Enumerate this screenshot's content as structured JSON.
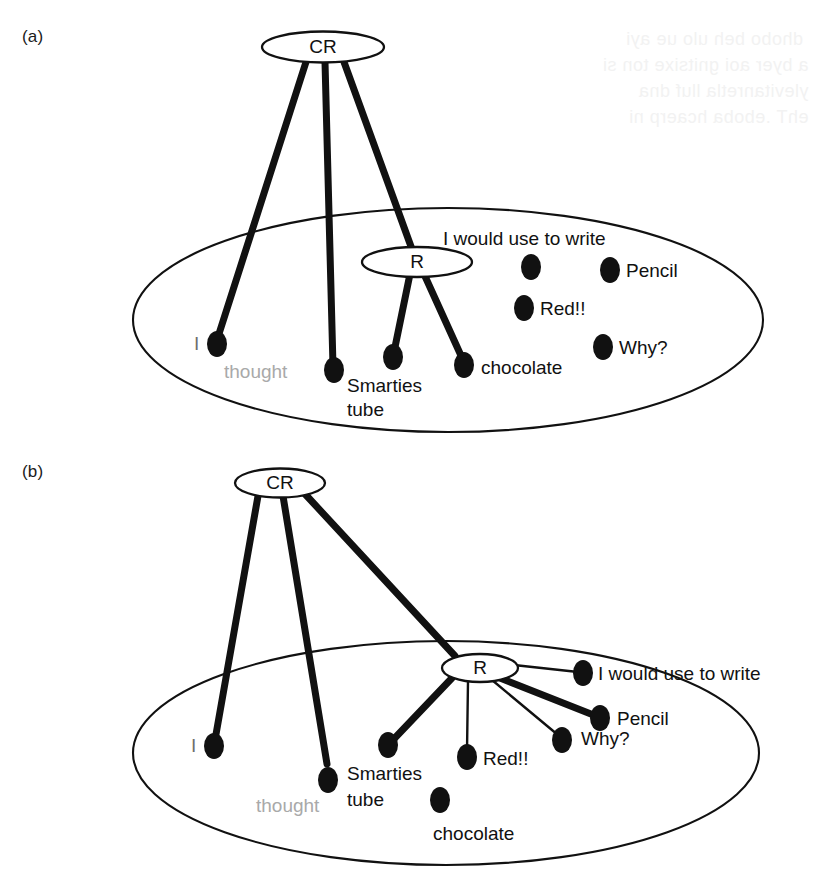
{
  "figure": {
    "type": "concept-map",
    "background": "#ffffff",
    "ink": "#111111",
    "faded_ink": "#a9a9a9",
    "panels": [
      {
        "id": "a",
        "label": "(a)",
        "boundary_name": "context-ellipse",
        "nodes": [
          {
            "id": "CR",
            "label": "CR"
          },
          {
            "id": "R",
            "label": "R"
          }
        ],
        "items": [
          {
            "id": "i",
            "label": "I",
            "style": "faded-small",
            "connected": true,
            "link": "CR"
          },
          {
            "id": "thought",
            "label": "thought",
            "style": "faded",
            "connected": true,
            "link": "CR"
          },
          {
            "id": "smarties",
            "label": "Smarties\ntube",
            "style": "normal",
            "connected": true,
            "link": "R"
          },
          {
            "id": "chocolate",
            "label": "chocolate",
            "style": "normal",
            "connected": true,
            "link": "R"
          },
          {
            "id": "write",
            "label": "I would use to write",
            "style": "normal",
            "connected": false,
            "link": null
          },
          {
            "id": "pencil",
            "label": "Pencil",
            "style": "normal",
            "connected": false,
            "link": null
          },
          {
            "id": "red",
            "label": "Red!!",
            "style": "normal",
            "connected": false,
            "link": null
          },
          {
            "id": "why",
            "label": "Why?",
            "style": "normal",
            "connected": false,
            "link": null
          }
        ]
      },
      {
        "id": "b",
        "label": "(b)",
        "boundary_name": "context-ellipse",
        "nodes": [
          {
            "id": "CR",
            "label": "CR"
          },
          {
            "id": "R",
            "label": "R"
          }
        ],
        "items": [
          {
            "id": "i",
            "label": "I",
            "style": "faded-small",
            "connected": true,
            "link": "CR"
          },
          {
            "id": "thought",
            "label": "thought",
            "style": "faded",
            "connected": true,
            "link": "CR"
          },
          {
            "id": "smarties",
            "label": "Smarties\ntube",
            "style": "normal",
            "connected": true,
            "link": "R"
          },
          {
            "id": "red",
            "label": "Red!!",
            "style": "normal",
            "connected": true,
            "link": "R"
          },
          {
            "id": "why",
            "label": "Why?",
            "style": "normal",
            "connected": true,
            "link": "R"
          },
          {
            "id": "pencil",
            "label": "Pencil",
            "style": "normal",
            "connected": true,
            "link": "R"
          },
          {
            "id": "write",
            "label": "I would use to write",
            "style": "normal",
            "connected": true,
            "link": "R"
          },
          {
            "id": "chocolate",
            "label": "chocolate",
            "style": "normal",
            "connected": false,
            "link": null
          }
        ]
      }
    ]
  },
  "panel_a": {
    "label": "(a)",
    "cr_label": "CR",
    "r_label": "R",
    "item_i": "I",
    "item_thought": "thought",
    "item_smarties_line1": "Smarties",
    "item_smarties_line2": "tube",
    "item_chocolate": "chocolate",
    "item_write": "I would use to write",
    "item_pencil": "Pencil",
    "item_red": "Red!!",
    "item_why": "Why?"
  },
  "panel_b": {
    "label": "(b)",
    "cr_label": "CR",
    "r_label": "R",
    "item_i": "I",
    "item_thought": "thought",
    "item_smarties_line1": "Smarties",
    "item_smarties_line2": "tube",
    "item_chocolate": "chocolate",
    "item_write": "I would use to write",
    "item_pencil": "Pencil",
    "item_red": "Red!!",
    "item_why": "Why?"
  }
}
